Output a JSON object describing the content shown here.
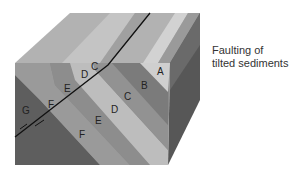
{
  "caption": {
    "line1": "Faulting of",
    "line2": "tilted sediments"
  },
  "layers": {
    "A": "A",
    "B": "B",
    "C": "C",
    "D": "D",
    "E": "E",
    "F": "F",
    "G": "G"
  },
  "colors": {
    "top_light": "#bdbdbd",
    "top_mid": "#a9a9a9",
    "top_pale": "#cfcfcf",
    "front_G": "#5f5f5f",
    "front_F": "#9a9a9a",
    "front_E": "#8a8a8a",
    "front_D": "#b8b8b8",
    "front_C": "#8e8e8e",
    "front_B": "#7c7c7c",
    "front_A": "#cdcdcd",
    "right_face": "#4e4e4e",
    "fault_line": "#111111"
  }
}
